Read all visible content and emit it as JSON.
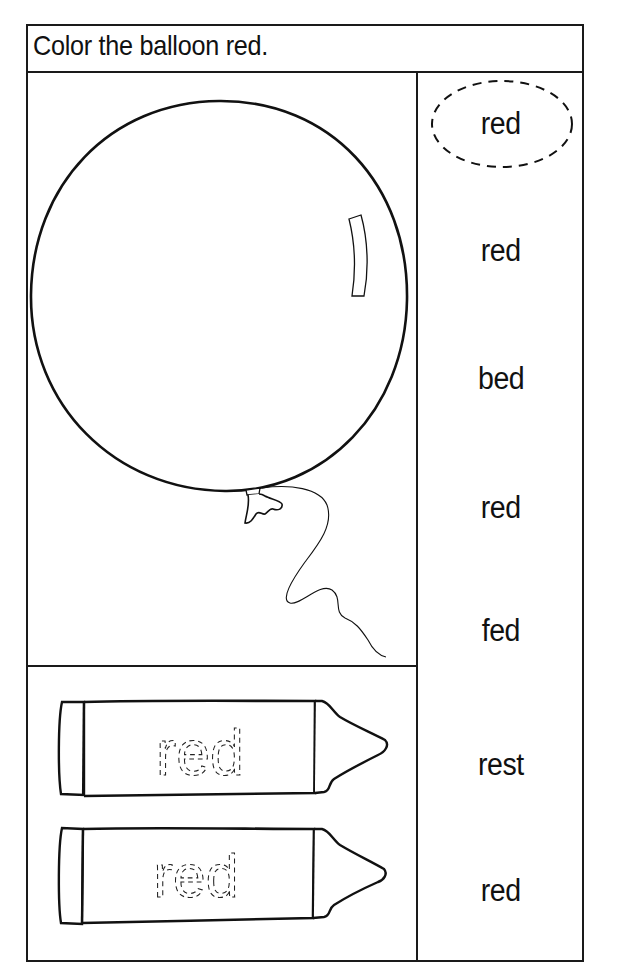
{
  "worksheet": {
    "instruction": "Color the balloon red.",
    "target_color": "red",
    "balloon": {
      "label": "balloon",
      "highlight": true,
      "string": true
    },
    "crayons": [
      {
        "traced_word": "red"
      },
      {
        "traced_word": "red"
      }
    ],
    "word_list": [
      {
        "text": "red",
        "circled": true
      },
      {
        "text": "red",
        "circled": false
      },
      {
        "text": "bed",
        "circled": false
      },
      {
        "text": "red",
        "circled": false
      },
      {
        "text": "fed",
        "circled": false
      },
      {
        "text": "rest",
        "circled": false
      },
      {
        "text": "red",
        "circled": false
      }
    ]
  },
  "colors": {
    "ink": "#111111",
    "paper": "#ffffff"
  }
}
